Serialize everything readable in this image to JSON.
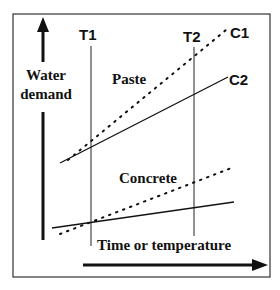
{
  "diagram": {
    "y_axis_label_line1": "Water",
    "y_axis_label_line2": "demand",
    "x_axis_label": "Time or temperature",
    "markers": [
      {
        "label": "T1"
      },
      {
        "label": "T2"
      }
    ],
    "curve_labels": [
      {
        "label": "C1",
        "style": "dotted"
      },
      {
        "label": "C2",
        "style": "solid"
      }
    ],
    "group_labels": [
      {
        "label": "Paste"
      },
      {
        "label": "Concrete"
      }
    ],
    "colors": {
      "line": "#111111",
      "frame": "#333333",
      "background": "#ffffff"
    }
  }
}
